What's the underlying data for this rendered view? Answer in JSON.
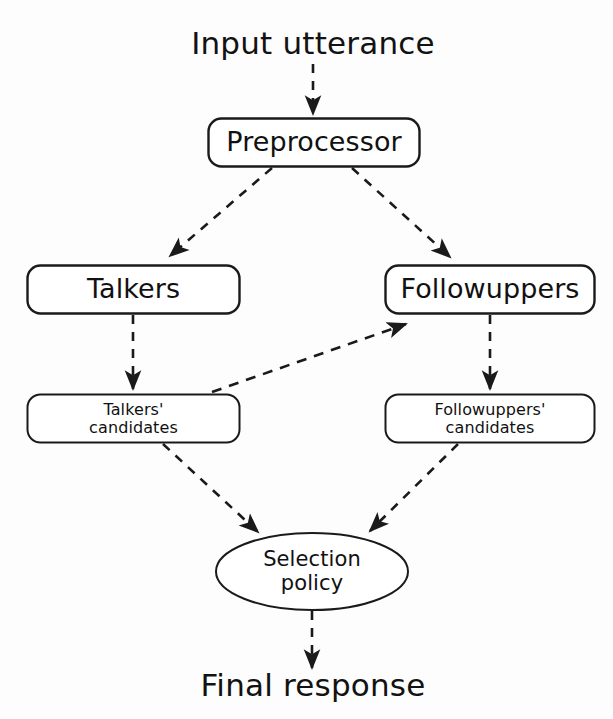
{
  "diagram": {
    "title_text_top": "Input utterance",
    "title_text_bottom": "Final response",
    "background_color": "#fdfdfd",
    "stroke_color": "#1a1a1a",
    "text_color": "#121212",
    "nodes": [
      {
        "id": "preprocessor",
        "label": "Preprocessor",
        "shape": "rounded-rect",
        "x": 208,
        "y": 118,
        "w": 212,
        "h": 49
      },
      {
        "id": "talkers",
        "label": "Talkers",
        "shape": "rounded-rect",
        "x": 27,
        "y": 265,
        "w": 213,
        "h": 49
      },
      {
        "id": "followuppers",
        "label": "Followuppers",
        "shape": "rounded-rect",
        "x": 385,
        "y": 265,
        "w": 210,
        "h": 49
      },
      {
        "id": "talkers-candidates",
        "label": "Talkers'\ncandidates",
        "shape": "rounded-rect",
        "x": 27,
        "y": 394,
        "w": 213,
        "h": 49
      },
      {
        "id": "followuppers-candidates",
        "label": "Followuppers'\ncandidates",
        "shape": "rounded-rect",
        "x": 385,
        "y": 394,
        "w": 210,
        "h": 49
      },
      {
        "id": "selection-policy",
        "label": "Selection\npolicy",
        "shape": "ellipse",
        "x": 216,
        "y": 533,
        "w": 192,
        "h": 77
      }
    ],
    "edges": [
      {
        "id": "input-to-preprocessor",
        "from": "input-utterance-text",
        "to": "preprocessor",
        "style": "dashed",
        "arrow": "end"
      },
      {
        "id": "preprocessor-to-talkers",
        "from": "preprocessor",
        "to": "talkers",
        "style": "dashed",
        "arrow": "end"
      },
      {
        "id": "preprocessor-to-followuppers",
        "from": "preprocessor",
        "to": "followuppers",
        "style": "dashed",
        "arrow": "end"
      },
      {
        "id": "talkers-to-talkers-candidates",
        "from": "talkers",
        "to": "talkers-candidates",
        "style": "dashed",
        "arrow": "end"
      },
      {
        "id": "followuppers-to-followuppers-candidates",
        "from": "followuppers",
        "to": "followuppers-candidates",
        "style": "dashed",
        "arrow": "end"
      },
      {
        "id": "talkers-candidates-to-followuppers",
        "from": "talkers-candidates",
        "to": "followuppers",
        "style": "dashed",
        "arrow": "end"
      },
      {
        "id": "talkers-candidates-to-selection-policy",
        "from": "talkers-candidates",
        "to": "selection-policy",
        "style": "dashed",
        "arrow": "end"
      },
      {
        "id": "followuppers-candidates-to-selection-policy",
        "from": "followuppers-candidates",
        "to": "selection-policy",
        "style": "dashed",
        "arrow": "end"
      },
      {
        "id": "selection-policy-to-final-response",
        "from": "selection-policy",
        "to": "final-response-text",
        "style": "dashed",
        "arrow": "end"
      }
    ]
  }
}
